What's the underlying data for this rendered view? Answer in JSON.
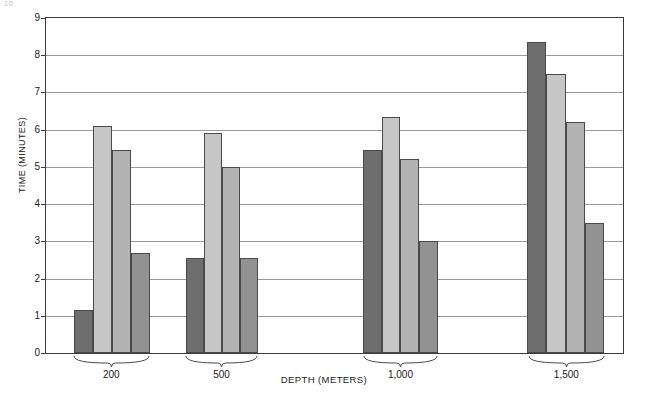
{
  "figure": {
    "corner_artifact": "10",
    "xlabel": "DEPTH (METERS)",
    "ylabel": "TIME (MINUTES)"
  },
  "chart_data": {
    "type": "bar",
    "title": "",
    "xlabel": "DEPTH (METERS)",
    "ylabel": "TIME (MINUTES)",
    "categories": [
      "200",
      "500",
      "1,000",
      "1,500"
    ],
    "ylim": [
      0,
      9
    ],
    "yticks": [
      0,
      1,
      2,
      3,
      4,
      5,
      6,
      7,
      8,
      9
    ],
    "ytick_labels": [
      "0",
      "1",
      "2",
      "3",
      "4",
      "5",
      "6",
      "7",
      "8",
      "9"
    ],
    "grid": true,
    "legend": "none",
    "series": [
      {
        "name": "series-1",
        "color": "#6e6e6e",
        "values": [
          1.15,
          2.55,
          5.45,
          8.35
        ]
      },
      {
        "name": "series-2",
        "color": "#c6c6c6",
        "values": [
          6.1,
          5.9,
          6.35,
          7.5
        ]
      },
      {
        "name": "series-3",
        "color": "#b3b3b3",
        "values": [
          5.45,
          5.0,
          5.2,
          6.2
        ]
      },
      {
        "name": "series-4",
        "color": "#929292",
        "values": [
          2.7,
          2.55,
          3.0,
          3.5
        ]
      }
    ]
  },
  "layout": {
    "group_centers_pct": [
      19.2,
      38.3,
      69.2,
      97.9
    ],
    "group_left_pct": [
      4.8,
      24.2,
      54.9,
      83.4
    ],
    "group_width_pct": [
      13.3,
      12.6,
      13.0,
      13.3
    ]
  }
}
